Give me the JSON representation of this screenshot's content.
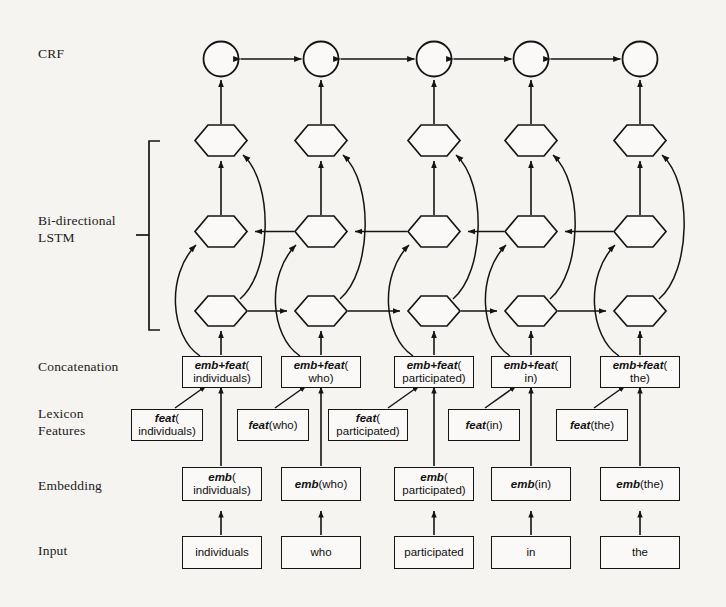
{
  "figure": {
    "type": "neural-network-architecture-diagram",
    "background_color": "#f6f4f1",
    "line_color": "#141414"
  },
  "row_labels": [
    {
      "id": "crf",
      "text": "CRF",
      "x": 38,
      "y": 52
    },
    {
      "id": "bilstm",
      "text": "Bi-directional\nLSTM",
      "x": 38,
      "y": 219
    },
    {
      "id": "concatenation",
      "text": "Concatenation",
      "x": 38,
      "y": 365
    },
    {
      "id": "lexicon",
      "text": "Lexicon\nFeatures",
      "x": 38,
      "y": 412
    },
    {
      "id": "embedding",
      "text": "Embedding",
      "x": 38,
      "y": 484
    },
    {
      "id": "input",
      "text": "Input",
      "x": 38,
      "y": 549
    }
  ],
  "tokens": [
    "individuals",
    "who",
    "participated",
    "in",
    "the"
  ],
  "columns": [
    {
      "index": 0,
      "token": "individuals",
      "input_label": "individuals",
      "embedding_label": {
        "fn": "emb",
        "arg": "individuals",
        "wrap": true
      },
      "feature_label": {
        "fn": "feat",
        "arg": "individuals",
        "wrap": true
      },
      "concat_label": {
        "fn": "emb+feat",
        "arg": "individuals",
        "wrap": true
      }
    },
    {
      "index": 1,
      "token": "who",
      "input_label": "who",
      "embedding_label": {
        "fn": "emb",
        "arg": "who",
        "wrap": false
      },
      "feature_label": {
        "fn": "feat",
        "arg": "who",
        "wrap": false
      },
      "concat_label": {
        "fn": "emb+feat",
        "arg": "who",
        "wrap": true
      }
    },
    {
      "index": 2,
      "token": "participated",
      "input_label": "participated",
      "embedding_label": {
        "fn": "emb",
        "arg": "participated",
        "wrap": true
      },
      "feature_label": {
        "fn": "feat",
        "arg": "participated",
        "wrap": true
      },
      "concat_label": {
        "fn": "emb+feat",
        "arg": "participated",
        "wrap": true
      }
    },
    {
      "index": 3,
      "token": "in",
      "input_label": "in",
      "embedding_label": {
        "fn": "emb",
        "arg": "in",
        "wrap": false
      },
      "feature_label": {
        "fn": "feat",
        "arg": "in",
        "wrap": false
      },
      "concat_label": {
        "fn": "emb+feat",
        "arg": "in",
        "wrap": true
      }
    },
    {
      "index": 4,
      "token": "the",
      "input_label": "the",
      "embedding_label": {
        "fn": "emb",
        "arg": "the",
        "wrap": false
      },
      "feature_label": {
        "fn": "feat",
        "arg": "the",
        "wrap": false
      },
      "concat_label": {
        "fn": "emb+feat",
        "arg": "the",
        "wrap": true
      }
    }
  ],
  "layers": {
    "crf": {
      "node_shape": "circle",
      "count": 5,
      "edge_style": "bidirectional-horizontal"
    },
    "lstm_top": {
      "node_shape": "hexagon",
      "count": 5
    },
    "lstm_backward": {
      "node_shape": "hexagon",
      "count": 5,
      "direction": "right-to-left"
    },
    "lstm_forward": {
      "node_shape": "hexagon",
      "count": 5,
      "direction": "left-to-right"
    }
  },
  "bracket": {
    "label_ref": "bilstm",
    "x": 148,
    "top": 141,
    "bottom": 330
  }
}
